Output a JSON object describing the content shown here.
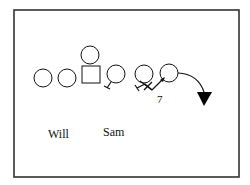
{
  "diagram": {
    "type": "football-play",
    "frame": {
      "x": 14,
      "y": 10,
      "width": 225,
      "height": 167,
      "stroke": "#333333"
    },
    "players": [
      {
        "id": "p1",
        "shape": "circle",
        "cx": 43,
        "cy": 78,
        "r": 9
      },
      {
        "id": "p2",
        "shape": "circle",
        "cx": 67,
        "cy": 78,
        "r": 9
      },
      {
        "id": "center",
        "shape": "square",
        "x": 82,
        "y": 66,
        "size": 18
      },
      {
        "id": "qb",
        "shape": "circle",
        "cx": 90,
        "cy": 55,
        "r": 9
      },
      {
        "id": "p4",
        "shape": "circle",
        "cx": 116,
        "cy": 74,
        "r": 9
      },
      {
        "id": "p5",
        "shape": "circle",
        "cx": 144,
        "cy": 74,
        "r": 9
      },
      {
        "id": "p6",
        "shape": "circle",
        "cx": 169,
        "cy": 73,
        "r": 9
      }
    ],
    "labels": {
      "will": "Will",
      "sam": "Sam",
      "number": "7"
    },
    "defender_marker": {
      "shape": "triangle-down",
      "fill": "#000000"
    },
    "line_color": "#111111"
  }
}
